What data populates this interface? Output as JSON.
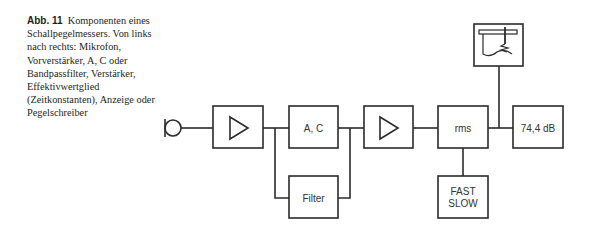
{
  "caption": {
    "figure_label": "Abb. 11",
    "text": "Komponenten eines Schallpegelmessers. Von links nach rechts: Mikrofon, Vorverstärker, A, C oder Bandpassfilter, Verstärker, Effektivwertglied (Zeitkonstanten), Anzeige oder Pegelschreiber"
  },
  "diagram": {
    "blocks": {
      "microphone": {
        "label": ""
      },
      "preamplifier": {
        "label": ""
      },
      "weighting": {
        "label": "A, C"
      },
      "filter": {
        "label": "Filter"
      },
      "amplifier": {
        "label": ""
      },
      "rms": {
        "label": "rms"
      },
      "time_constant": {
        "line1": "FAST",
        "line2": "SLOW"
      },
      "display": {
        "label": "74,4 dB"
      },
      "level_recorder": {
        "label": ""
      }
    },
    "colors": {
      "stroke": "#2b2b2b",
      "text": "#333333"
    }
  }
}
